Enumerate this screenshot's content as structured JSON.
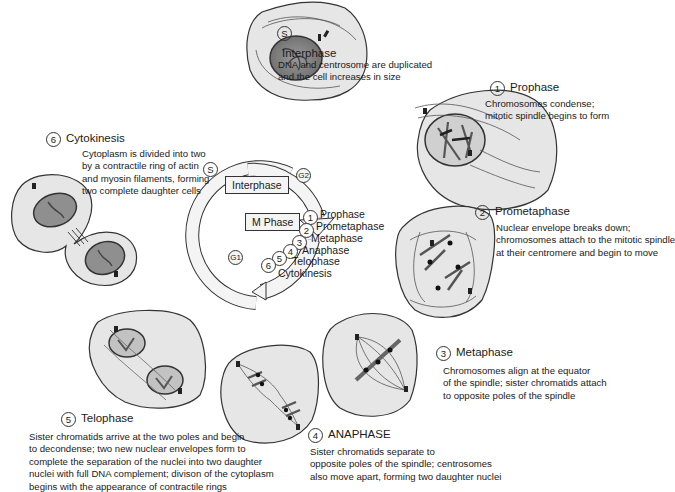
{
  "stages": [
    {
      "id": "S",
      "badge": "S",
      "title": "Interphase",
      "desc": [
        "DNA and centrosome are duplicated",
        "and the cell increases in size"
      ]
    },
    {
      "id": "1",
      "badge": "1",
      "title": "Prophase",
      "desc": [
        "Chromosomes condense;",
        "mitotic spindle begins to form"
      ]
    },
    {
      "id": "2",
      "badge": "2",
      "title": "Prometaphase",
      "desc": [
        "Nuclear envelope breaks down;",
        "chromosomes attach to the mitotic spindle",
        "at their centromere and begin to move"
      ]
    },
    {
      "id": "3",
      "badge": "3",
      "title": "Metaphase",
      "desc": [
        "Chromosomes align at the equator",
        "of the spindle; sister chromatids attach",
        "to opposite poles of the spindle"
      ]
    },
    {
      "id": "4",
      "badge": "4",
      "title": "ANAPHASE",
      "desc": [
        "Sister chromatids separate to",
        "opposite poles of the spindle; centrosomes",
        "also move apart, forming two daughter nuclei"
      ]
    },
    {
      "id": "5",
      "badge": "5",
      "title": "Telophase",
      "desc": [
        "Sister chromatids arrive at the two poles and begin",
        "to decondense; two new nuclear envelopes form to",
        "complete the separation of the nuclei into two daughter",
        "nuclei with full DNA complement;  divison of the cytoplasm",
        "begins with the appearance of contractile rings"
      ]
    },
    {
      "id": "6",
      "badge": "6",
      "title": "Cytokinesis",
      "desc": [
        "Cytoplasm is divided into two",
        "by a contractile ring of actin",
        "and myosin filaments, forming",
        "two complete daughter cells"
      ]
    }
  ],
  "cycle": {
    "interphase_box": "Interphase",
    "mphase_box": "M Phase",
    "markers": {
      "s": "S",
      "g2": "G2",
      "g1": "G1"
    },
    "phase_numbers": [
      "1",
      "2",
      "3",
      "4",
      "5",
      "6"
    ],
    "phase_labels": [
      "Prophase",
      "Prometaphase",
      "Metaphase",
      "Anaphase",
      "Telophase",
      "Cytokinesis"
    ]
  },
  "colors": {
    "cell_fill": "#e6e6e6",
    "outline": "#333333",
    "nucleus": "#8a8a8a",
    "chromosome": "#555555",
    "text": "#1a1a1a"
  }
}
